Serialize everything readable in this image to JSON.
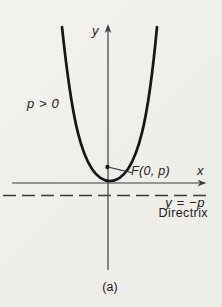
{
  "figure": {
    "caption": "(a)",
    "labels": {
      "y_axis": "y",
      "x_axis": "x",
      "condition": "p > 0",
      "focus": "F(0, p)",
      "directrix_equation": "y = −p",
      "directrix_word": "Directrix"
    },
    "colors": {
      "background": "#f0efeb",
      "curve": "#161616",
      "axis": "#3c3c3c",
      "text": "#232323"
    }
  }
}
